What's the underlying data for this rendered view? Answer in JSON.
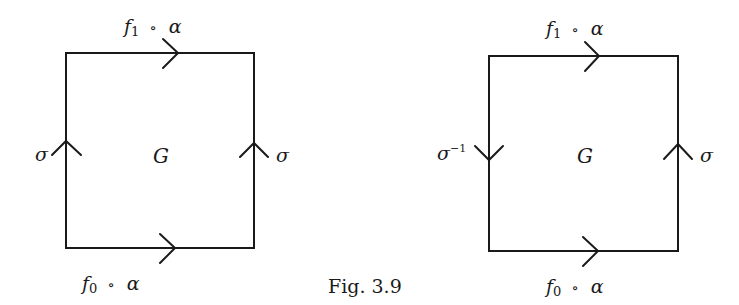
{
  "figure": {
    "caption": "Fig. 3.9",
    "left_square": {
      "top_label": {
        "f": "f",
        "sub": "1",
        "op": "∘",
        "alpha": "α"
      },
      "bottom_label": {
        "f": "f",
        "sub": "0",
        "op": "∘",
        "alpha": "α"
      },
      "left_label": {
        "sym": "σ",
        "sup": ""
      },
      "right_label": {
        "sym": "σ",
        "sup": ""
      },
      "center_label": "G",
      "left_arrow_direction": "up",
      "right_arrow_direction": "up",
      "top_arrow_direction": "right",
      "bottom_arrow_direction": "right"
    },
    "right_square": {
      "top_label": {
        "f": "f",
        "sub": "1",
        "op": "∘",
        "alpha": "α"
      },
      "bottom_label": {
        "f": "f",
        "sub": "0",
        "op": "∘",
        "alpha": "α"
      },
      "left_label": {
        "sym": "σ",
        "sup": "−1"
      },
      "right_label": {
        "sym": "σ",
        "sup": ""
      },
      "center_label": "G",
      "left_arrow_direction": "down",
      "right_arrow_direction": "up",
      "top_arrow_direction": "right",
      "bottom_arrow_direction": "right"
    }
  }
}
